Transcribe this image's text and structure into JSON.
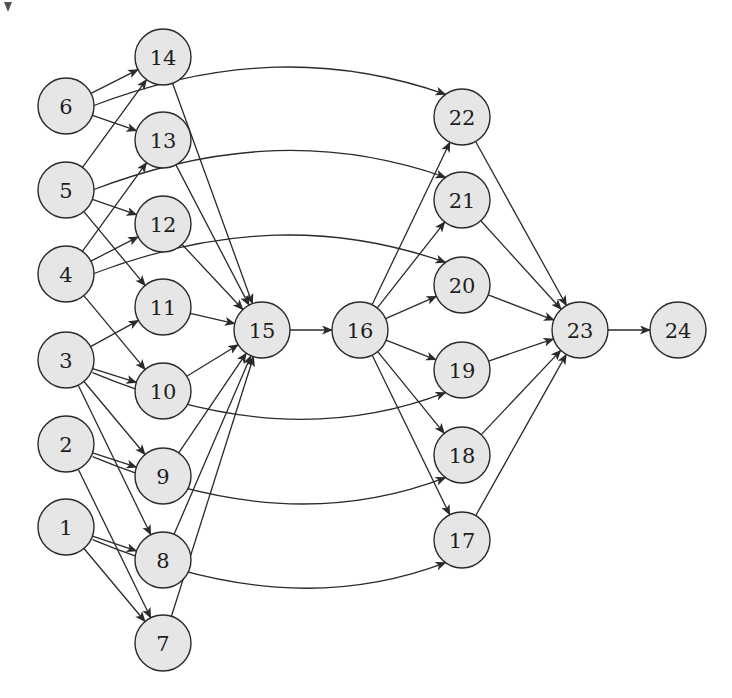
{
  "diagram": {
    "type": "directed-graph",
    "node_radius": 28,
    "colors": {
      "node_fill": "#e6e6e6",
      "node_stroke": "#2a2a2a",
      "edge": "#2a2a2a",
      "text": "#1e1e1e",
      "background": "#ffffff"
    },
    "nodes": [
      {
        "id": "1",
        "label": "1",
        "x": 66,
        "y": 527
      },
      {
        "id": "2",
        "label": "2",
        "x": 66,
        "y": 444
      },
      {
        "id": "3",
        "label": "3",
        "x": 66,
        "y": 360
      },
      {
        "id": "4",
        "label": "4",
        "x": 66,
        "y": 274
      },
      {
        "id": "5",
        "label": "5",
        "x": 66,
        "y": 190
      },
      {
        "id": "6",
        "label": "6",
        "x": 66,
        "y": 106
      },
      {
        "id": "7",
        "label": "7",
        "x": 163,
        "y": 643
      },
      {
        "id": "8",
        "label": "8",
        "x": 163,
        "y": 560
      },
      {
        "id": "9",
        "label": "9",
        "x": 163,
        "y": 476
      },
      {
        "id": "10",
        "label": "10",
        "x": 163,
        "y": 391
      },
      {
        "id": "11",
        "label": "11",
        "x": 163,
        "y": 307
      },
      {
        "id": "12",
        "label": "12",
        "x": 163,
        "y": 224
      },
      {
        "id": "13",
        "label": "13",
        "x": 163,
        "y": 140
      },
      {
        "id": "14",
        "label": "14",
        "x": 163,
        "y": 57
      },
      {
        "id": "15",
        "label": "15",
        "x": 262,
        "y": 330
      },
      {
        "id": "16",
        "label": "16",
        "x": 360,
        "y": 330
      },
      {
        "id": "17",
        "label": "17",
        "x": 462,
        "y": 540
      },
      {
        "id": "18",
        "label": "18",
        "x": 462,
        "y": 455
      },
      {
        "id": "19",
        "label": "19",
        "x": 462,
        "y": 370
      },
      {
        "id": "20",
        "label": "20",
        "x": 462,
        "y": 285
      },
      {
        "id": "21",
        "label": "21",
        "x": 462,
        "y": 200
      },
      {
        "id": "22",
        "label": "22",
        "x": 462,
        "y": 117
      },
      {
        "id": "23",
        "label": "23",
        "x": 580,
        "y": 330
      },
      {
        "id": "24",
        "label": "24",
        "x": 678,
        "y": 330
      }
    ],
    "edges": [
      {
        "from": "6",
        "to": "14"
      },
      {
        "from": "6",
        "to": "13"
      },
      {
        "from": "6",
        "to": "22",
        "curved": true
      },
      {
        "from": "5",
        "to": "14"
      },
      {
        "from": "5",
        "to": "12"
      },
      {
        "from": "5",
        "to": "11"
      },
      {
        "from": "5",
        "to": "21",
        "curved": true
      },
      {
        "from": "4",
        "to": "13"
      },
      {
        "from": "4",
        "to": "12"
      },
      {
        "from": "4",
        "to": "10"
      },
      {
        "from": "4",
        "to": "20",
        "curved": true
      },
      {
        "from": "3",
        "to": "11"
      },
      {
        "from": "3",
        "to": "10"
      },
      {
        "from": "3",
        "to": "9"
      },
      {
        "from": "3",
        "to": "8"
      },
      {
        "from": "3",
        "to": "19",
        "curved": true
      },
      {
        "from": "2",
        "to": "9"
      },
      {
        "from": "2",
        "to": "7"
      },
      {
        "from": "2",
        "to": "18",
        "curved": true
      },
      {
        "from": "1",
        "to": "8"
      },
      {
        "from": "1",
        "to": "7"
      },
      {
        "from": "1",
        "to": "17",
        "curved": true
      },
      {
        "from": "14",
        "to": "15"
      },
      {
        "from": "13",
        "to": "15"
      },
      {
        "from": "12",
        "to": "15"
      },
      {
        "from": "11",
        "to": "15"
      },
      {
        "from": "10",
        "to": "15"
      },
      {
        "from": "9",
        "to": "15"
      },
      {
        "from": "8",
        "to": "15"
      },
      {
        "from": "7",
        "to": "15"
      },
      {
        "from": "15",
        "to": "16"
      },
      {
        "from": "16",
        "to": "22"
      },
      {
        "from": "16",
        "to": "21"
      },
      {
        "from": "16",
        "to": "20"
      },
      {
        "from": "16",
        "to": "19"
      },
      {
        "from": "16",
        "to": "18"
      },
      {
        "from": "16",
        "to": "17"
      },
      {
        "from": "22",
        "to": "23"
      },
      {
        "from": "21",
        "to": "23"
      },
      {
        "from": "20",
        "to": "23"
      },
      {
        "from": "19",
        "to": "23"
      },
      {
        "from": "18",
        "to": "23"
      },
      {
        "from": "17",
        "to": "23"
      },
      {
        "from": "23",
        "to": "24"
      }
    ]
  }
}
